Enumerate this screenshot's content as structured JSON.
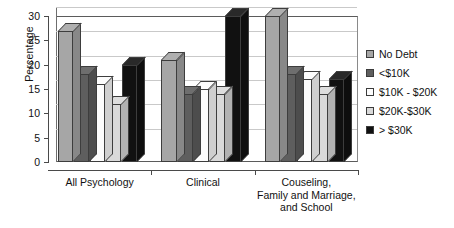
{
  "chart_data": {
    "type": "bar",
    "title": "",
    "xlabel": "",
    "ylabel": "Percentage",
    "ylim": [
      0,
      30
    ],
    "yticks": [
      0,
      5,
      10,
      15,
      20,
      25,
      30
    ],
    "grid": true,
    "legend_position": "right",
    "note": "Grouped 3-D style column chart; bars exceeding the 30 axis maximum are clipped at the top of the plot area.",
    "categories": [
      "All Psychology",
      "Clinical",
      "Couseling, Family and Marriage, and School"
    ],
    "category_lines": [
      [
        "All Psychology"
      ],
      [
        "Clinical"
      ],
      [
        "Couseling,",
        "Family and Marriage,",
        "and School"
      ]
    ],
    "series": [
      {
        "name": "No Debt",
        "color": "#a6a6a6",
        "values": [
          27,
          21,
          30
        ]
      },
      {
        "name": "<$10K",
        "color": "#5e5e5e",
        "values": [
          18,
          14,
          18
        ]
      },
      {
        "name": "$10K - $20K",
        "color": "#fcfcfc",
        "values": [
          16,
          15,
          17
        ]
      },
      {
        "name": "$20K-$30K",
        "color": "#d9d9d9",
        "values": [
          12,
          14,
          14
        ]
      },
      {
        "name": "> $30K",
        "color": "#111111",
        "values": [
          20,
          30,
          17
        ]
      }
    ]
  },
  "legend": {
    "items": [
      {
        "label": "No Debt",
        "color": "#a6a6a6"
      },
      {
        "label": "<$10K",
        "color": "#5e5e5e"
      },
      {
        "label": "$10K - $20K",
        "color": "#fcfcfc"
      },
      {
        "label": "$20K-$30K",
        "color": "#d9d9d9"
      },
      {
        "label": "> $30K",
        "color": "#111111"
      }
    ]
  }
}
